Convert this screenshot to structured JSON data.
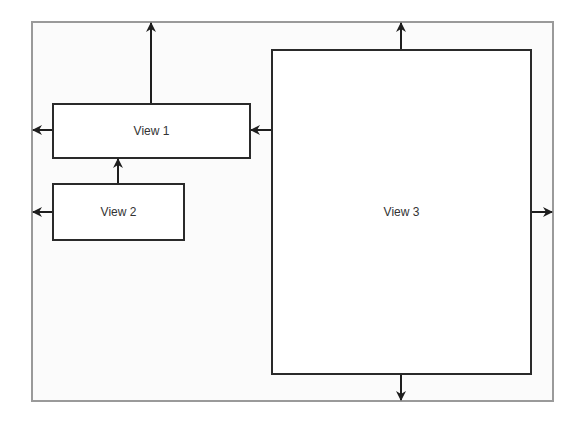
{
  "diagram": {
    "container": {
      "x": 31,
      "y": 21,
      "w": 523,
      "h": 381,
      "border": "#9a9a9a"
    },
    "views": [
      {
        "id": "view-1",
        "label": "View 1",
        "x": 52,
        "y": 103,
        "w": 199,
        "h": 56
      },
      {
        "id": "view-2",
        "label": "View 2",
        "x": 52,
        "y": 183,
        "w": 133,
        "h": 58
      },
      {
        "id": "view-3",
        "label": "View 3",
        "x": 271,
        "y": 49,
        "w": 261,
        "h": 326
      }
    ],
    "arrows": [
      {
        "name": "view1-up-arrow",
        "from": "View 1",
        "direction": "up",
        "x1": 151,
        "y1": 103,
        "x2": 151,
        "y2": 23
      },
      {
        "name": "view1-left-arrow",
        "from": "View 1",
        "direction": "left",
        "x1": 52,
        "y1": 130,
        "x2": 33,
        "y2": 130
      },
      {
        "name": "view3-to-view1-arrow",
        "from": "View 3",
        "to": "View 1",
        "direction": "left",
        "x1": 271,
        "y1": 130,
        "x2": 251,
        "y2": 130
      },
      {
        "name": "view2-to-view1-arrow",
        "from": "View 2",
        "to": "View 1",
        "direction": "up",
        "x1": 118,
        "y1": 183,
        "x2": 118,
        "y2": 159
      },
      {
        "name": "view2-left-arrow",
        "from": "View 2",
        "direction": "left",
        "x1": 52,
        "y1": 212,
        "x2": 33,
        "y2": 212
      },
      {
        "name": "view3-up-arrow",
        "from": "View 3",
        "direction": "up",
        "x1": 401,
        "y1": 49,
        "x2": 401,
        "y2": 23
      },
      {
        "name": "view3-right-arrow",
        "from": "View 3",
        "direction": "right",
        "x1": 532,
        "y1": 212,
        "x2": 552,
        "y2": 212
      },
      {
        "name": "view3-down-arrow",
        "from": "View 3",
        "direction": "down",
        "x1": 401,
        "y1": 375,
        "x2": 401,
        "y2": 400
      }
    ],
    "colors": {
      "line": "#1e1e1e",
      "box_border": "#2a2a2a",
      "frame_border": "#9a9a9a",
      "text": "#333333"
    }
  }
}
